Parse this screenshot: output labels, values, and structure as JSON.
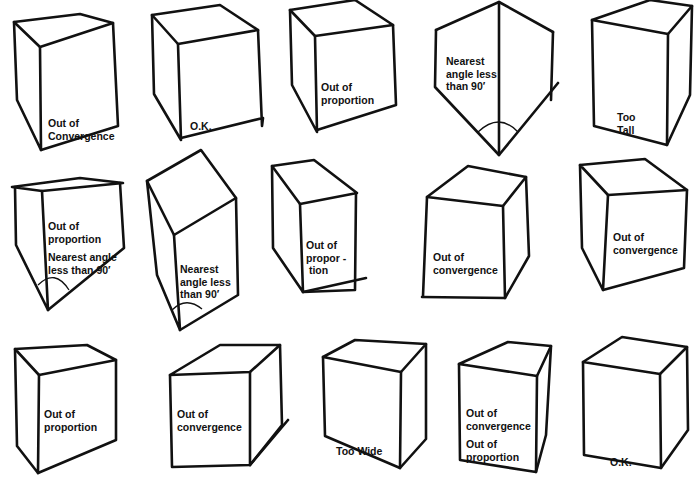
{
  "diagram": {
    "colors": {
      "ink": "#111111",
      "paper": "#ffffff"
    },
    "boxes": [
      {
        "id": 1,
        "row": 1,
        "col": 1,
        "verdict": "Out of Convergence",
        "lines": [
          "Out of",
          "Convergence"
        ]
      },
      {
        "id": 2,
        "row": 1,
        "col": 2,
        "verdict": "O.K.",
        "lines": [
          "O.K."
        ]
      },
      {
        "id": 3,
        "row": 1,
        "col": 3,
        "verdict": "Out of proportion",
        "lines": [
          "Out of",
          "proportion"
        ]
      },
      {
        "id": 4,
        "row": 1,
        "col": 4,
        "verdict": "Nearest angle less than 90'",
        "lines": [
          "Nearest",
          "angle less",
          "than 90′"
        ]
      },
      {
        "id": 5,
        "row": 1,
        "col": 5,
        "verdict": "Too Tall",
        "lines": [
          "Too",
          "Tall"
        ]
      },
      {
        "id": 6,
        "row": 2,
        "col": 1,
        "verdict": "Out of proportion; Nearest angle less than 90'",
        "lines": [
          "Out of",
          "proportion",
          "",
          "Nearest angle",
          "less than 90′"
        ]
      },
      {
        "id": 7,
        "row": 2,
        "col": 2,
        "verdict": "Nearest angle less than 90'",
        "lines": [
          "Nearest",
          "angle less",
          "than 90′"
        ]
      },
      {
        "id": 8,
        "row": 2,
        "col": 3,
        "verdict": "Out of proportion",
        "lines": [
          "Out of",
          "propor -",
          " tion"
        ]
      },
      {
        "id": 9,
        "row": 2,
        "col": 4,
        "verdict": "Out of convergence",
        "lines": [
          "Out of",
          "convergence"
        ]
      },
      {
        "id": 10,
        "row": 2,
        "col": 5,
        "verdict": "Out of convergence",
        "lines": [
          "Out of",
          "convergence"
        ]
      },
      {
        "id": 11,
        "row": 3,
        "col": 1,
        "verdict": "Out of proportion",
        "lines": [
          "Out of",
          "proportion"
        ]
      },
      {
        "id": 12,
        "row": 3,
        "col": 2,
        "verdict": "Out of convergence",
        "lines": [
          "Out of",
          "convergence"
        ]
      },
      {
        "id": 13,
        "row": 3,
        "col": 3,
        "verdict": "Too Wide",
        "lines": [
          "Too Wide"
        ]
      },
      {
        "id": 14,
        "row": 3,
        "col": 4,
        "verdict": "Out of convergence; Out of proportion",
        "lines": [
          "Out of",
          "convergence",
          "",
          "Out of",
          "proportion"
        ]
      },
      {
        "id": 15,
        "row": 3,
        "col": 5,
        "verdict": "O.K.",
        "lines": [
          "O.K."
        ]
      }
    ]
  }
}
